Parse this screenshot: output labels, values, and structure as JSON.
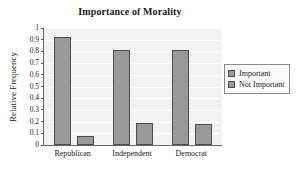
{
  "chart_data": {
    "type": "bar",
    "title": "Importance of Morality",
    "xlabel": "",
    "ylabel": "Relative Frequency",
    "categories": [
      "Republican",
      "Independent",
      "Democrat"
    ],
    "series": [
      {
        "name": "Important",
        "values": [
          0.92,
          0.81,
          0.81
        ],
        "color": "#999999"
      },
      {
        "name": "Not Important",
        "values": [
          0.08,
          0.19,
          0.18
        ],
        "color": "#999999"
      }
    ],
    "ylim": [
      0,
      1
    ],
    "ytick_labels": [
      "1",
      "0.9",
      "0.8",
      "0.7",
      "0.6",
      "0.5",
      "0.4",
      "0.3",
      "0.2",
      "0.1",
      "0"
    ],
    "ytick_values": [
      1,
      0.9,
      0.8,
      0.7,
      0.6,
      0.5,
      0.4,
      0.3,
      0.2,
      0.1,
      0
    ],
    "grid": true,
    "grid_color": "#ffffff",
    "plot_background": "#f2f2f2",
    "bar_edge_color": "#4d4d4d",
    "legend_position": "right"
  }
}
